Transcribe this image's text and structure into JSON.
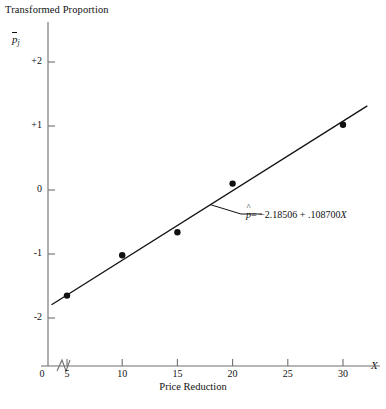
{
  "chart_data": {
    "type": "scatter",
    "title": "",
    "ylabel": "Transformed Proportion",
    "ylabel_symbol": "p",
    "ylabel_symbol_sub": "j",
    "xlabel": "Price Reduction",
    "xlabel_symbol": "X",
    "x": [
      5,
      10,
      15,
      20,
      30
    ],
    "values": [
      -1.65,
      -1.02,
      -0.66,
      0.1,
      1.02
    ],
    "points": [
      {
        "x": 5,
        "y": -1.65
      },
      {
        "x": 10,
        "y": -1.02
      },
      {
        "x": 15,
        "y": -0.66
      },
      {
        "x": 20,
        "y": 0.1
      },
      {
        "x": 30,
        "y": 1.02
      }
    ],
    "xticks": [
      5,
      10,
      15,
      20,
      25,
      30
    ],
    "xtick_labels": [
      "5",
      "10",
      "15",
      "20",
      "25",
      "30"
    ],
    "x_origin_label": "0",
    "yticks": [
      2,
      1,
      0,
      -1,
      -2
    ],
    "ytick_labels": [
      "+2",
      "+1",
      "0",
      "-1",
      "-2"
    ],
    "xlim": [
      3.2,
      32.5
    ],
    "ylim": [
      -2.3,
      2.3
    ],
    "grid": false,
    "legend": null,
    "axis_break": true,
    "fit": {
      "type": "line",
      "intercept": -2.18506,
      "slope": 0.1087,
      "equation": "= −2.18506 + .108700",
      "equation_symbol": "p",
      "equation_x": "X"
    },
    "annotation": {
      "text": "= −2.18506 + .108700",
      "points_to_x": 18.0,
      "points_to_y": -0.23
    },
    "marker_color": "#111111",
    "line_color": "#111111",
    "axis_color": "#6f6f6f"
  }
}
